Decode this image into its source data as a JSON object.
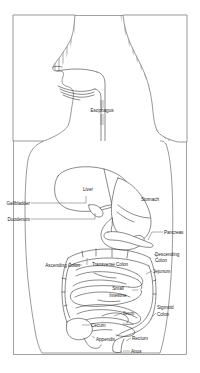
{
  "figure": {
    "background_color": "#ffffff",
    "frame_color": "#8a8a8a",
    "line_color": "#2b2b2b",
    "hatch_color": "#8e8e8e",
    "label_color": "#1a1a1a"
  },
  "labels": {
    "esophagus": "Esophagus",
    "liver": "Liver",
    "stomach": "Stomach",
    "gallbladder": "Gallbladder",
    "duodenum": "Duodenum",
    "pancreas": "Pancreas",
    "transverse_colon": "Transverse Colon",
    "descending_colon_l1": "Descending",
    "descending_colon_l2": "Colon",
    "ascending_colon": "Ascending Colon",
    "jejunum": "Jejunum",
    "small_intestine_l1": "Small",
    "small_intestine_l2": "Intestine",
    "sigmoid_colon_l1": "Sigmoid",
    "sigmoid_colon_l2": "Colon",
    "cecum": "Cecum",
    "ileum": "Ileum",
    "appendix": "Appendix",
    "rectum": "Rectum",
    "anus": "Anus"
  }
}
